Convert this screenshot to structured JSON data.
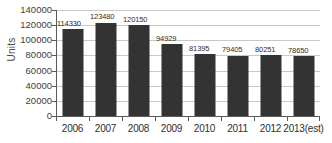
{
  "chart_data": {
    "type": "bar",
    "title": "",
    "subtitle": "",
    "xlabel": "",
    "ylabel": "Units",
    "categories": [
      "2006",
      "2007",
      "2008",
      "2009",
      "2010",
      "2011",
      "2012",
      "2013(est)"
    ],
    "values": [
      114330,
      123480,
      120150,
      94929,
      81395,
      79405,
      80251,
      78650
    ],
    "value_labels": [
      "114330",
      "123480",
      "120150",
      "94929",
      "81395",
      "79405",
      "80251",
      "78650"
    ],
    "ylim": [
      0,
      140000
    ],
    "ytick_values": [
      0,
      20000,
      40000,
      60000,
      80000,
      100000,
      120000,
      140000
    ],
    "ytick_labels": [
      "0",
      "20000",
      "40000",
      "60000",
      "80000",
      "100000",
      "120000",
      "140000"
    ],
    "grid": true,
    "legend": false,
    "legend_position": "none",
    "bar_color": "#333333",
    "gridline_color": "#c8c8c8",
    "axis_color": "#5a5a5a",
    "background_color": "#ffffff",
    "text_color": "#2e2e2e"
  }
}
